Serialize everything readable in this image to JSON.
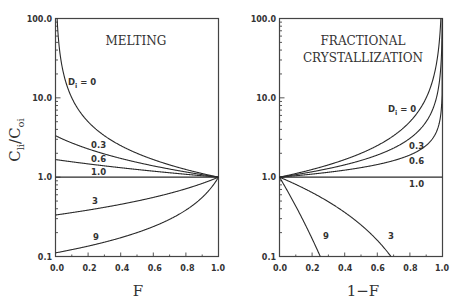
{
  "chart_data": [
    {
      "type": "line",
      "title": "MELTING",
      "xlabel": "F",
      "ylabel": "C_li/C_oi",
      "yscale": "log",
      "xlim": [
        0.0,
        1.0
      ],
      "ylim": [
        0.1,
        100.0
      ],
      "xticks": [
        "0.0",
        "0.2",
        "0.4",
        "0.6",
        "0.8",
        "1.0"
      ],
      "yticks": [
        "0.1",
        "1.0",
        "10.0",
        "100.0"
      ],
      "grid": false,
      "model": "batch melting: C/C0 = 1 / (D + F(1 - D))",
      "series": [
        {
          "name": "D_i = 0",
          "D": 0,
          "label": "D",
          "label_sub": "i",
          "label_suffix": " = 0",
          "points": [
            [
              0.01,
              100.0
            ],
            [
              0.05,
              20.0
            ],
            [
              0.1,
              10.0
            ],
            [
              0.2,
              5.0
            ],
            [
              0.4,
              2.5
            ],
            [
              0.6,
              1.67
            ],
            [
              0.8,
              1.25
            ],
            [
              1.0,
              1.0
            ]
          ]
        },
        {
          "name": "0.3",
          "D": 0.3,
          "label": "0.3",
          "points": [
            [
              0.0,
              3.33
            ],
            [
              0.2,
              2.17
            ],
            [
              0.4,
              1.72
            ],
            [
              0.6,
              1.39
            ],
            [
              0.8,
              1.16
            ],
            [
              1.0,
              1.0
            ]
          ]
        },
        {
          "name": "0.6",
          "D": 0.6,
          "label": "0.6",
          "points": [
            [
              0.0,
              1.67
            ],
            [
              0.2,
              1.47
            ],
            [
              0.4,
              1.32
            ],
            [
              0.6,
              1.19
            ],
            [
              0.8,
              1.09
            ],
            [
              1.0,
              1.0
            ]
          ]
        },
        {
          "name": "1.0",
          "D": 1.0,
          "label": "1.0",
          "points": [
            [
              0.0,
              1.0
            ],
            [
              1.0,
              1.0
            ]
          ]
        },
        {
          "name": "3",
          "D": 3,
          "label": "3",
          "points": [
            [
              0.0,
              0.333
            ],
            [
              0.2,
              0.385
            ],
            [
              0.4,
              0.455
            ],
            [
              0.6,
              0.556
            ],
            [
              0.8,
              0.714
            ],
            [
              1.0,
              1.0
            ]
          ]
        },
        {
          "name": "9",
          "D": 9,
          "label": "9",
          "points": [
            [
              0.0,
              0.111
            ],
            [
              0.2,
              0.139
            ],
            [
              0.4,
              0.185
            ],
            [
              0.6,
              0.278
            ],
            [
              0.8,
              0.556
            ],
            [
              1.0,
              1.0
            ]
          ]
        }
      ]
    },
    {
      "type": "line",
      "title": "FRACTIONAL CRYSTALLIZATION",
      "title_lines": [
        "FRACTIONAL",
        "CRYSTALLIZATION"
      ],
      "xlabel": "1−F",
      "ylabel": "",
      "yscale": "log",
      "xlim": [
        0.0,
        1.0
      ],
      "ylim": [
        0.1,
        100.0
      ],
      "xticks": [
        "0.0",
        "0.2",
        "0.4",
        "0.6",
        "0.8",
        "1.0"
      ],
      "yticks": [
        "0.1",
        "1.0",
        "10.0",
        "100.0"
      ],
      "grid": false,
      "model": "Rayleigh fractional crystallization: C/C0 = F^(D - 1)",
      "series": [
        {
          "name": "D_i = 0",
          "D": 0,
          "label": "D",
          "label_sub": "i",
          "label_suffix": " = 0",
          "points": [
            [
              0.0,
              1.0
            ],
            [
              0.2,
              1.25
            ],
            [
              0.4,
              1.67
            ],
            [
              0.6,
              2.5
            ],
            [
              0.8,
              5.0
            ],
            [
              0.9,
              10.0
            ],
            [
              0.99,
              100.0
            ]
          ]
        },
        {
          "name": "0.3",
          "D": 0.3,
          "label": "0.3",
          "points": [
            [
              0.0,
              1.0
            ],
            [
              0.2,
              1.17
            ],
            [
              0.4,
              1.43
            ],
            [
              0.6,
              1.9
            ],
            [
              0.8,
              3.09
            ],
            [
              0.9,
              5.01
            ],
            [
              0.999,
              125.9
            ]
          ]
        },
        {
          "name": "0.6",
          "D": 0.6,
          "label": "0.6",
          "points": [
            [
              0.0,
              1.0
            ],
            [
              0.2,
              1.09
            ],
            [
              0.4,
              1.23
            ],
            [
              0.6,
              1.44
            ],
            [
              0.8,
              1.9
            ],
            [
              0.9,
              2.51
            ],
            [
              0.999,
              15.8
            ]
          ]
        },
        {
          "name": "1.0",
          "D": 1.0,
          "label": "1.0",
          "points": [
            [
              0.0,
              1.0
            ],
            [
              1.0,
              1.0
            ]
          ]
        },
        {
          "name": "3",
          "D": 3,
          "label": "3",
          "points": [
            [
              0.0,
              1.0
            ],
            [
              0.2,
              0.64
            ],
            [
              0.4,
              0.36
            ],
            [
              0.6,
              0.16
            ],
            [
              0.68,
              0.102
            ]
          ]
        },
        {
          "name": "9",
          "D": 9,
          "label": "9",
          "points": [
            [
              0.0,
              1.0
            ],
            [
              0.1,
              0.43
            ],
            [
              0.2,
              0.168
            ],
            [
              0.25,
              0.1
            ]
          ]
        }
      ]
    }
  ],
  "panels": {
    "left": {
      "title": "MELTING",
      "xlabel": "F",
      "ylabel_main": "C",
      "ylabel_sub1": "li",
      "ylabel_mid": "/C",
      "ylabel_sub2": "oi",
      "d_label_main": "D",
      "d_label_sub": "i",
      "d_label_suffix": " = 0",
      "labels": {
        "d03": "0.3",
        "d06": "0.6",
        "d10": "1.0",
        "d3": "3",
        "d9": "9"
      }
    },
    "right": {
      "title_line1": "FRACTIONAL",
      "title_line2": "CRYSTALLIZATION",
      "xlabel": "1−F",
      "d_label_main": "D",
      "d_label_sub": "i",
      "d_label_suffix": " = 0",
      "labels": {
        "d03": "0.3",
        "d06": "0.6",
        "d10": "1.0",
        "d3": "3",
        "d9": "9"
      }
    },
    "xticks": [
      "0.0",
      "0.2",
      "0.4",
      "0.6",
      "0.8",
      "1.0"
    ],
    "yticks": [
      "0.1",
      "1.0",
      "10.0",
      "100.0"
    ]
  }
}
